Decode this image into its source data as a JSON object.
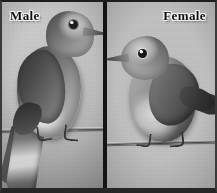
{
  "figure": {
    "type": "two-panel-comparison-photograph",
    "rendering": "grayscale",
    "width": 217,
    "height": 193,
    "border_color": "#1d1d1d",
    "divider_color": "#141414"
  },
  "panels": [
    {
      "id": "male",
      "label": "Male",
      "label_position": "top-left",
      "background_color": "#c2c2c2",
      "bird": {
        "facing": "right",
        "plumage": "dark upperparts with pale breast and long tail",
        "perched_on": "branch"
      }
    },
    {
      "id": "female",
      "label": "Female",
      "label_position": "top-right",
      "background_color": "#c4c4c4",
      "bird": {
        "facing": "left",
        "plumage": "uniformly gray with darker wings",
        "perched_on": "branch"
      }
    }
  ],
  "labels": {
    "male": "Male",
    "female": "Female"
  }
}
